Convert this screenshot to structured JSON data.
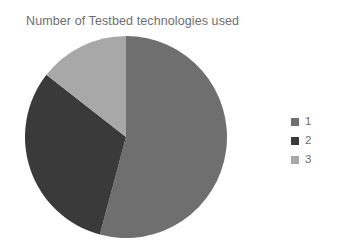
{
  "chart_data": {
    "type": "pie",
    "title": "Number of Testbed technologies used",
    "xlabel": "",
    "ylabel": "",
    "legend_position": "right",
    "grid": false,
    "categories": [
      "1",
      "2",
      "3"
    ],
    "values": [
      54,
      31,
      15
    ],
    "units": "percent",
    "slice_angles_deg": [
      195,
      113,
      52
    ],
    "start_angle_deg": 0,
    "direction": "clockwise",
    "colors": [
      "#6f6f6f",
      "#3a3a3a",
      "#a8a8a8"
    ],
    "slices": [
      {
        "label": "1",
        "value": 54,
        "angle_deg": 195,
        "color": "#6f6f6f"
      },
      {
        "label": "2",
        "value": 31,
        "angle_deg": 113,
        "color": "#3a3a3a"
      },
      {
        "label": "3",
        "value": 15,
        "angle_deg": 52,
        "color": "#a8a8a8"
      }
    ],
    "legend": [
      {
        "label": "1",
        "color": "#6f6f6f"
      },
      {
        "label": "2",
        "color": "#3a3a3a"
      },
      {
        "label": "3",
        "color": "#a8a8a8"
      }
    ]
  },
  "title": {
    "text": "Number of Testbed technologies used",
    "color": "#6d6d6d"
  },
  "legend": {
    "items": [
      {
        "label": "1",
        "color": "#6f6f6f"
      },
      {
        "label": "2",
        "color": "#3a3a3a"
      },
      {
        "label": "3",
        "color": "#a8a8a8"
      }
    ]
  },
  "background_color": "#ffffff"
}
